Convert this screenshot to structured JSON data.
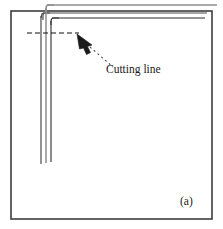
{
  "figure": {
    "panel_label": "(a)",
    "annotation_label": "Cutting line",
    "colors": {
      "frame": "#3c3c3c",
      "sheet_dark": "#2b2b2b",
      "sheet_mid": "#6f6f6f",
      "sheet_light": "#9a9a9a",
      "dashed_line": "#111111",
      "arrow": "#1a1a1a",
      "leader": "#4a4a4a",
      "text": "#1a1a1a",
      "background": "#ffffff"
    },
    "frame": {
      "x": 11,
      "y": 11,
      "width": 201,
      "height": 208,
      "stroke_width": 1.6
    },
    "sheet_edges": {
      "horizontal": [
        {
          "name": "outer-top-edge",
          "y": 5,
          "x_start": 47,
          "x_end": 217,
          "color": "#8e8e8e",
          "width": 1.5
        },
        {
          "name": "middle-top-edge",
          "y": 13,
          "x_start": 43,
          "x_end": 207,
          "color": "#4a4a4a",
          "width": 1.2
        },
        {
          "name": "inner-top-edge",
          "y": 18,
          "x_start": 52,
          "x_end": 205,
          "color": "#2b2b2b",
          "width": 1.1
        }
      ],
      "vertical": [
        {
          "name": "outer-left-edge",
          "x": 41,
          "y_start": 13,
          "y_end": 164,
          "color": "#4a4a4a",
          "width": 1.2
        },
        {
          "name": "middle-left-edge",
          "x": 46,
          "y_start": 5,
          "y_end": 163,
          "color": "#8e8e8e",
          "width": 1.5
        },
        {
          "name": "inner-left-edge",
          "x": 51,
          "y_start": 18,
          "y_end": 162,
          "color": "#2b2b2b",
          "width": 1.1
        }
      ]
    },
    "cutting_dashed_line": {
      "x_start": 27,
      "x_end": 79,
      "y": 33,
      "dash": "5 3",
      "width": 1.2
    },
    "arrow": {
      "tip_x": 77,
      "tip_y": 34,
      "tail_x": 104,
      "tail_y": 61,
      "head_length": 14,
      "head_width": 9
    },
    "leader_line": {
      "x_start": 90,
      "y_start": 47,
      "x_end": 112,
      "y_end": 66,
      "dash": "2 3",
      "width": 1.1
    }
  }
}
